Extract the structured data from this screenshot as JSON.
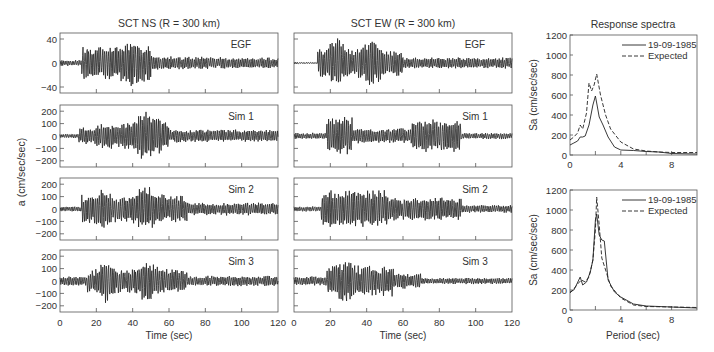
{
  "chart_data": [
    {
      "type": "line",
      "title": "SCT NS (R = 300 km)",
      "xlabel": "Time (sec)",
      "ylabel": "a (cm/sec/sec)",
      "x_ticks": [
        0,
        20,
        40,
        60,
        80,
        100,
        120
      ],
      "xlim": [
        0,
        120
      ],
      "panels": [
        {
          "label": "EGF",
          "ylim": [
            -50,
            50
          ],
          "y_ticks": [
            -40,
            0,
            40
          ],
          "peak": 38
        },
        {
          "label": "Sim 1",
          "ylim": [
            -250,
            250
          ],
          "y_ticks": [
            -200,
            -100,
            0,
            100,
            200
          ],
          "peak": 210
        },
        {
          "label": "Sim 2",
          "ylim": [
            -250,
            250
          ],
          "y_ticks": [
            -200,
            -100,
            0,
            100,
            200
          ],
          "peak": 210
        },
        {
          "label": "Sim 3",
          "ylim": [
            -250,
            250
          ],
          "y_ticks": [
            -200,
            -100,
            0,
            100,
            200
          ],
          "peak": 165
        }
      ]
    },
    {
      "type": "line",
      "title": "SCT EW (R = 300 km)",
      "xlabel": "Time (sec)",
      "x_ticks": [
        0,
        20,
        40,
        60,
        80,
        100,
        120
      ],
      "xlim": [
        0,
        120
      ],
      "panels": [
        {
          "label": "EGF"
        },
        {
          "label": "Sim 1"
        },
        {
          "label": "Sim 2"
        },
        {
          "label": "Sim 3"
        }
      ]
    },
    {
      "type": "line",
      "title": "Response spectra",
      "ylabel": "Sa (cm/sec/sec)",
      "xlim": [
        0,
        10
      ],
      "ylim": [
        0,
        1200
      ],
      "x_ticks": [
        0,
        4,
        8
      ],
      "y_ticks": [
        0,
        200,
        400,
        600,
        800,
        1000,
        1200
      ],
      "legend": [
        "19-09-1985",
        "Expected"
      ],
      "series": [
        {
          "name": "19-09-1985",
          "style": "solid",
          "x": [
            0,
            0.3,
            0.6,
            0.8,
            1.0,
            1.2,
            1.5,
            1.8,
            2.0,
            2.1,
            2.3,
            2.6,
            3.0,
            3.5,
            4.0,
            5.0,
            6.0,
            7.0,
            8.0,
            10.0
          ],
          "y": [
            100,
            120,
            140,
            180,
            180,
            190,
            300,
            500,
            590,
            520,
            380,
            300,
            180,
            80,
            50,
            45,
            35,
            30,
            15,
            10
          ]
        },
        {
          "name": "Expected",
          "style": "dashed",
          "x": [
            0,
            0.3,
            0.6,
            0.8,
            1.0,
            1.3,
            1.5,
            1.7,
            1.9,
            2.1,
            2.4,
            2.8,
            3.2,
            4.0,
            5.0,
            6.0,
            7.0,
            8.0,
            10.0
          ],
          "y": [
            150,
            180,
            220,
            300,
            260,
            420,
            720,
            640,
            700,
            810,
            600,
            400,
            260,
            130,
            60,
            40,
            30,
            25,
            25
          ]
        }
      ]
    },
    {
      "type": "line",
      "xlabel": "Period (sec)",
      "ylabel": "Sa (cm/sec/sec)",
      "xlim": [
        0,
        10
      ],
      "ylim": [
        0,
        1200
      ],
      "x_ticks": [
        0,
        4,
        8
      ],
      "y_ticks": [
        0,
        200,
        400,
        600,
        800,
        1000,
        1200
      ],
      "legend": [
        "19-09-1985",
        "Expected"
      ],
      "series": [
        {
          "name": "19-09-1985",
          "style": "solid",
          "x": [
            0,
            0.3,
            0.5,
            0.8,
            1.0,
            1.3,
            1.6,
            1.8,
            2.0,
            2.1,
            2.3,
            2.5,
            2.7,
            3.0,
            3.5,
            4.0,
            5.0,
            6.0,
            8.0,
            10.0
          ],
          "y": [
            180,
            200,
            250,
            330,
            250,
            280,
            380,
            500,
            900,
            960,
            750,
            700,
            690,
            300,
            180,
            130,
            60,
            40,
            30,
            20
          ]
        },
        {
          "name": "Expected",
          "style": "dashed",
          "x": [
            0,
            0.3,
            0.6,
            0.9,
            1.2,
            1.5,
            1.8,
            2.0,
            2.1,
            2.3,
            2.5,
            2.8,
            3.2,
            4.0,
            5.0,
            6.0,
            8.0,
            10.0
          ],
          "y": [
            170,
            210,
            260,
            300,
            280,
            330,
            500,
            800,
            1130,
            850,
            520,
            400,
            240,
            120,
            50,
            35,
            30,
            25
          ]
        }
      ]
    }
  ],
  "labels": {
    "ns_title": "SCT NS (R = 300 km)",
    "ew_title": "SCT EW (R = 300 km)",
    "rs_title": "Response spectra",
    "ylabel_left": "a (cm/sec/sec)",
    "xlabel_time": "Time (sec)",
    "xlabel_period": "Period (sec)",
    "ylabel_sa": "Sa (cm/sec/sec)",
    "legend_solid": "19-09-1985",
    "legend_dashed": "Expected",
    "panels": [
      "EGF",
      "Sim 1",
      "Sim 2",
      "Sim 3"
    ]
  }
}
